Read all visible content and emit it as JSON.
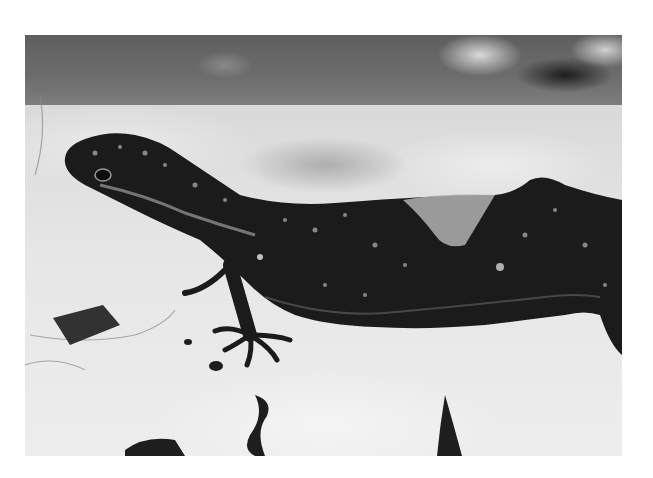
{
  "image": {
    "subject": "gecko on rock",
    "style": "grayscale photograph",
    "colors": {
      "background": "#ffffff",
      "foliage_dark": "#5f5f5f",
      "rock_light": "#e6e6e6",
      "gecko_body": "#1a1a1a",
      "gecko_spots": "#8c8c8c",
      "shed_skin_patch": "#a8a8a8"
    }
  }
}
